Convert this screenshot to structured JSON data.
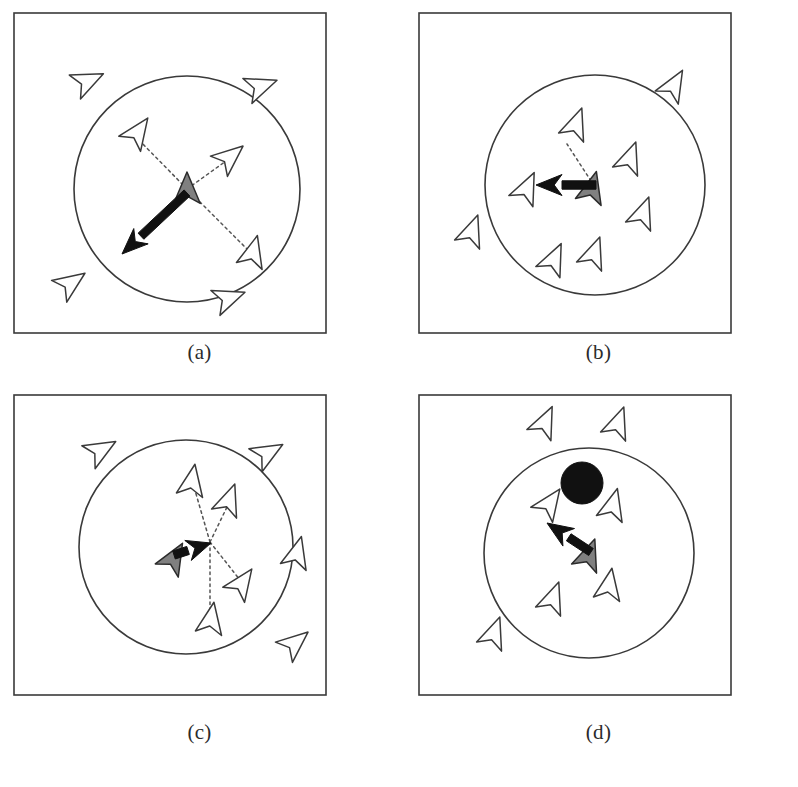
{
  "figure": {
    "background_color": "#ffffff",
    "stroke_color": "#3a3a3a",
    "boid_fill": "#ffffff",
    "focal_boid_fill": "#808080",
    "force_arrow_color": "#111111",
    "obstacle_color": "#111111",
    "dotted_line_color": "#555555"
  },
  "panels": [
    {
      "id": "a",
      "caption": "(a)",
      "behaviour": "separation",
      "frame": {
        "x": 14,
        "y": 13,
        "w": 312,
        "h": 320
      },
      "neighborhood_circle": {
        "cx": 173,
        "cy": 176,
        "r": 113
      },
      "focal_boid": {
        "x": 173,
        "y": 176,
        "angle": -90,
        "size": 17,
        "fill": "#808080"
      },
      "force_arrow": {
        "x1": 173,
        "y1": 180,
        "x2": 108,
        "y2": 241
      },
      "obstacle": null,
      "dotted_links": [
        {
          "x1": 173,
          "y1": 176,
          "x2": 123,
          "y2": 125
        },
        {
          "x1": 173,
          "y1": 176,
          "x2": 212,
          "y2": 148
        },
        {
          "x1": 173,
          "y1": 176,
          "x2": 233,
          "y2": 236
        }
      ],
      "neighbor_boids": [
        {
          "x": 124,
          "y": 119,
          "angle": -55,
          "size": 17,
          "inside": true
        },
        {
          "x": 216,
          "y": 144,
          "angle": -40,
          "size": 17,
          "inside": true
        },
        {
          "x": 239,
          "y": 239,
          "angle": -75,
          "size": 17,
          "inside": true
        }
      ],
      "outside_boids": [
        {
          "x": 74,
          "y": 68,
          "angle": -25,
          "size": 17
        },
        {
          "x": 247,
          "y": 73,
          "angle": -20,
          "size": 17
        },
        {
          "x": 57,
          "y": 270,
          "angle": -35,
          "size": 17
        },
        {
          "x": 215,
          "y": 285,
          "angle": -20,
          "size": 17
        }
      ]
    },
    {
      "id": "b",
      "caption": "(b)",
      "behaviour": "alignment",
      "frame": {
        "x": 20,
        "y": 13,
        "w": 312,
        "h": 320
      },
      "neighborhood_circle": {
        "cx": 176,
        "cy": 172,
        "r": 110
      },
      "focal_boid": {
        "x": 173,
        "y": 175,
        "angle": -75,
        "size": 17,
        "fill": "#808080"
      },
      "force_arrow": {
        "x1": 177,
        "y1": 172,
        "x2": 117,
        "y2": 172
      },
      "obstacle": null,
      "dotted_links": [
        {
          "x1": 172,
          "y1": 168,
          "x2": 148,
          "y2": 131
        }
      ],
      "neighbor_boids": [
        {
          "x": 157,
          "y": 111,
          "angle": -70,
          "size": 17,
          "inside": true
        },
        {
          "x": 211,
          "y": 145,
          "angle": -70,
          "size": 17,
          "inside": true
        },
        {
          "x": 108,
          "y": 175,
          "angle": -65,
          "size": 17,
          "inside": true
        },
        {
          "x": 224,
          "y": 200,
          "angle": -70,
          "size": 17,
          "inside": true
        },
        {
          "x": 175,
          "y": 240,
          "angle": -70,
          "size": 17,
          "inside": true
        },
        {
          "x": 135,
          "y": 246,
          "angle": -65,
          "size": 17,
          "inside": true
        }
      ],
      "outside_boids": [
        {
          "x": 255,
          "y": 72,
          "angle": -60,
          "size": 17
        },
        {
          "x": 53,
          "y": 218,
          "angle": -70,
          "size": 17
        }
      ]
    },
    {
      "id": "c",
      "caption": "(c)",
      "behaviour": "cohesion",
      "frame": {
        "x": 14,
        "y": 8,
        "w": 312,
        "h": 300
      },
      "neighborhood_circle": {
        "cx": 172,
        "cy": 152,
        "r": 107
      },
      "focal_boid": {
        "x": 160,
        "y": 163,
        "angle": -60,
        "size": 17,
        "fill": "#808080"
      },
      "force_arrow": {
        "x1": 160,
        "y1": 160,
        "x2": 197,
        "y2": 148
      },
      "obstacle": null,
      "center_of_mass": {
        "x": 196,
        "y": 147
      },
      "dotted_links": [
        {
          "x1": 196,
          "y1": 147,
          "x2": 180,
          "y2": 92
        },
        {
          "x1": 196,
          "y1": 147,
          "x2": 214,
          "y2": 110
        },
        {
          "x1": 196,
          "y1": 147,
          "x2": 226,
          "y2": 185
        },
        {
          "x1": 196,
          "y1": 147,
          "x2": 196,
          "y2": 218
        }
      ],
      "neighbor_boids": [
        {
          "x": 178,
          "y": 86,
          "angle": -80,
          "size": 17,
          "inside": true
        },
        {
          "x": 215,
          "y": 105,
          "angle": -70,
          "size": 17,
          "inside": true
        },
        {
          "x": 228,
          "y": 188,
          "angle": -55,
          "size": 17,
          "inside": true
        },
        {
          "x": 197,
          "y": 224,
          "angle": -80,
          "size": 17,
          "inside": true
        }
      ],
      "outside_boids": [
        {
          "x": 87,
          "y": 55,
          "angle": -30,
          "size": 17
        },
        {
          "x": 254,
          "y": 58,
          "angle": -30,
          "size": 17
        },
        {
          "x": 283,
          "y": 158,
          "angle": -75,
          "size": 17
        },
        {
          "x": 281,
          "y": 248,
          "angle": -40,
          "size": 17
        }
      ]
    },
    {
      "id": "d",
      "caption": "(d)",
      "behaviour": "obstacle-avoidance",
      "frame": {
        "x": 20,
        "y": 8,
        "w": 312,
        "h": 300
      },
      "neighborhood_circle": {
        "cx": 170,
        "cy": 158,
        "r": 105
      },
      "focal_boid": {
        "x": 170,
        "y": 160,
        "angle": -70,
        "size": 17,
        "fill": "#808080"
      },
      "force_arrow": {
        "x1": 172,
        "y1": 157,
        "x2": 128,
        "y2": 128
      },
      "obstacle": {
        "cx": 163,
        "cy": 88,
        "r": 21,
        "fill": "#111111"
      },
      "dotted_links": [],
      "neighbor_boids": [
        {
          "x": 131,
          "y": 108,
          "angle": -55,
          "size": 17,
          "inside": true
        },
        {
          "x": 194,
          "y": 110,
          "angle": -75,
          "size": 17,
          "inside": true
        },
        {
          "x": 190,
          "y": 190,
          "angle": -80,
          "size": 17,
          "inside": true
        },
        {
          "x": 134,
          "y": 203,
          "angle": -70,
          "size": 17,
          "inside": true
        }
      ],
      "outside_boids": [
        {
          "x": 126,
          "y": 27,
          "angle": -65,
          "size": 17
        },
        {
          "x": 199,
          "y": 28,
          "angle": -70,
          "size": 17
        },
        {
          "x": 75,
          "y": 238,
          "angle": -70,
          "size": 17
        }
      ]
    }
  ]
}
